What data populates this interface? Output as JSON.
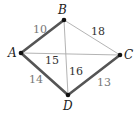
{
  "diagram": {
    "type": "weighted-graph",
    "vertices": [
      {
        "id": "A",
        "label": "A",
        "x": 21,
        "y": 53,
        "lx": 8,
        "ly": 57
      },
      {
        "id": "B",
        "label": "B",
        "x": 64,
        "y": 20,
        "lx": 58,
        "ly": 14
      },
      {
        "id": "C",
        "label": "C",
        "x": 120,
        "y": 55,
        "lx": 124,
        "ly": 59
      },
      {
        "id": "D",
        "label": "D",
        "x": 68,
        "y": 95,
        "lx": 63,
        "ly": 110
      }
    ],
    "edges": [
      {
        "from": "A",
        "to": "B",
        "weight": "10",
        "highlighted": true,
        "lx": 33,
        "ly": 33,
        "color": "#777777"
      },
      {
        "from": "B",
        "to": "C",
        "weight": "18",
        "highlighted": false,
        "lx": 91,
        "ly": 35,
        "color": "#333333"
      },
      {
        "from": "A",
        "to": "C",
        "weight": "15",
        "highlighted": false,
        "lx": 45,
        "ly": 64,
        "color": "#333333"
      },
      {
        "from": "B",
        "to": "D",
        "weight": "16",
        "highlighted": false,
        "lx": 69,
        "ly": 75,
        "color": "#333333"
      },
      {
        "from": "A",
        "to": "D",
        "weight": "14",
        "highlighted": true,
        "lx": 29,
        "ly": 83,
        "color": "#777777"
      },
      {
        "from": "D",
        "to": "C",
        "weight": "13",
        "highlighted": true,
        "lx": 97,
        "ly": 86,
        "color": "#777777"
      }
    ],
    "colors": {
      "highlighted_edge": "#555555",
      "normal_edge": "#aaaaaa",
      "vertex": "#111111"
    }
  }
}
